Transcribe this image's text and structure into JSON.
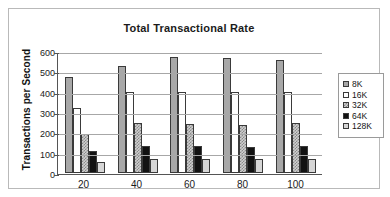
{
  "chart_data": {
    "type": "bar",
    "title": "Total Transactional Rate",
    "xlabel": "",
    "ylabel": "Transactions per Second",
    "categories": [
      "20",
      "40",
      "60",
      "80",
      "100"
    ],
    "ylim": [
      0,
      600
    ],
    "yticks": [
      "600",
      "500",
      "400",
      "300",
      "200",
      "100",
      "0"
    ],
    "grid": true,
    "legend_position": "right",
    "series": [
      {
        "name": "8K",
        "swatch_color": "#a8a8a8",
        "values": [
          473,
          525,
          570,
          565,
          555
        ]
      },
      {
        "name": "16K",
        "swatch_color": "#ffffff",
        "values": [
          318,
          400,
          398,
          398,
          398
        ]
      },
      {
        "name": "32K",
        "swatch_color": "#cfcfcf",
        "values": [
          194,
          244,
          243,
          238,
          244
        ]
      },
      {
        "name": "64K",
        "swatch_color": "#121212",
        "values": [
          106,
          133,
          133,
          126,
          135
        ]
      },
      {
        "name": "128K",
        "swatch_color": "#d6d6d6",
        "values": [
          52,
          68,
          68,
          69,
          70
        ]
      }
    ]
  }
}
